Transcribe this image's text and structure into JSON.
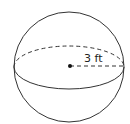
{
  "diagram": {
    "shape": "sphere",
    "radius_label": "3 ft",
    "stroke_color": "#333333",
    "background": "#ffffff"
  }
}
